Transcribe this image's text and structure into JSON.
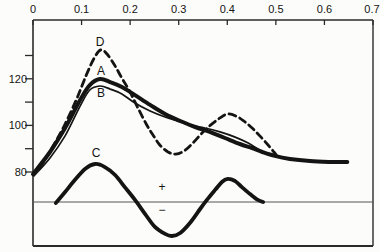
{
  "figure": {
    "background": "#fcfcfa",
    "ink_color": "#141414",
    "frame_color": "#2a2a2a",
    "baseline_color": "#555555"
  },
  "chart_data": {
    "type": "line",
    "title": "",
    "xlabel": "",
    "ylabel": "",
    "grid": false,
    "legend": "none (curves labeled inline: D, A, B, C)",
    "x_axis": {
      "position": "top",
      "range": [
        0,
        0.7
      ],
      "tick_values": [
        0,
        0.1,
        0.2,
        0.3,
        0.4,
        0.5,
        0.6,
        0.7
      ],
      "tick_labels": [
        "0",
        "0.1",
        "0.2",
        "0.3",
        "0.4",
        "0.5",
        "0.6",
        "0.7"
      ]
    },
    "y_axis": {
      "position": "left",
      "tick_values": [
        130,
        120,
        110,
        100,
        90,
        80
      ],
      "tick_labels": [
        "",
        "120",
        "",
        "100",
        "",
        "80"
      ]
    },
    "baseline": {
      "note": "zero line for difference curve C",
      "y_value": 0
    },
    "series": [
      {
        "name": "A",
        "style": "solid-thick",
        "width": 4.0,
        "dashed": false,
        "scale": "y",
        "points": [
          [
            0.0,
            79.1
          ],
          [
            0.035,
            88.6
          ],
          [
            0.066,
            98.9
          ],
          [
            0.097,
            110.9
          ],
          [
            0.117,
            117.3
          ],
          [
            0.138,
            119.9
          ],
          [
            0.159,
            118.6
          ],
          [
            0.183,
            116.5
          ],
          [
            0.21,
            113.0
          ],
          [
            0.241,
            108.8
          ],
          [
            0.272,
            104.9
          ],
          [
            0.303,
            101.9
          ],
          [
            0.334,
            99.3
          ],
          [
            0.364,
            97.2
          ],
          [
            0.395,
            94.6
          ],
          [
            0.426,
            92.0
          ],
          [
            0.451,
            90.3
          ],
          [
            0.472,
            88.6
          ],
          [
            0.498,
            86.9
          ],
          [
            0.529,
            85.6
          ],
          [
            0.57,
            84.7
          ],
          [
            0.612,
            84.3
          ],
          [
            0.647,
            84.3
          ]
        ]
      },
      {
        "name": "B",
        "style": "solid-thin",
        "width": 1.7,
        "dashed": false,
        "scale": "y",
        "points": [
          [
            0.002,
            78.3
          ],
          [
            0.035,
            86.0
          ],
          [
            0.066,
            95.5
          ],
          [
            0.097,
            108.3
          ],
          [
            0.117,
            115.2
          ],
          [
            0.138,
            116.9
          ],
          [
            0.159,
            115.6
          ],
          [
            0.183,
            113.5
          ],
          [
            0.21,
            109.6
          ],
          [
            0.241,
            106.2
          ],
          [
            0.272,
            103.6
          ],
          [
            0.299,
            101.9
          ],
          [
            0.323,
            100.2
          ],
          [
            0.354,
            98.9
          ],
          [
            0.385,
            97.2
          ],
          [
            0.416,
            95.0
          ],
          [
            0.443,
            92.4
          ],
          [
            0.463,
            89.9
          ],
          [
            0.472,
            88.6
          ]
        ]
      },
      {
        "name": "D",
        "style": "dashed-thick",
        "width": 2.8,
        "dashed": true,
        "scale": "y",
        "points": [
          [
            0.014,
            81.7
          ],
          [
            0.039,
            90.3
          ],
          [
            0.064,
            99.7
          ],
          [
            0.089,
            110.9
          ],
          [
            0.109,
            121.2
          ],
          [
            0.126,
            128.9
          ],
          [
            0.14,
            132.4
          ],
          [
            0.154,
            130.2
          ],
          [
            0.169,
            125.5
          ],
          [
            0.183,
            120.3
          ],
          [
            0.2,
            114.3
          ],
          [
            0.216,
            107.5
          ],
          [
            0.233,
            100.6
          ],
          [
            0.247,
            95.9
          ],
          [
            0.261,
            91.6
          ],
          [
            0.278,
            88.6
          ],
          [
            0.294,
            87.7
          ],
          [
            0.311,
            89.0
          ],
          [
            0.329,
            92.4
          ],
          [
            0.348,
            96.7
          ],
          [
            0.366,
            100.2
          ],
          [
            0.385,
            103.2
          ],
          [
            0.401,
            104.9
          ],
          [
            0.418,
            104.0
          ],
          [
            0.434,
            101.9
          ],
          [
            0.451,
            98.9
          ],
          [
            0.467,
            95.5
          ],
          [
            0.484,
            91.6
          ],
          [
            0.496,
            88.6
          ],
          [
            0.502,
            86.9
          ]
        ]
      },
      {
        "name": "C",
        "style": "solid-thick",
        "width": 3.8,
        "dashed": false,
        "scale": "baseline",
        "points": [
          [
            0.047,
            -0.4
          ],
          [
            0.066,
            4.3
          ],
          [
            0.086,
            9.4
          ],
          [
            0.107,
            14.2
          ],
          [
            0.128,
            16.3
          ],
          [
            0.148,
            15.0
          ],
          [
            0.169,
            11.6
          ],
          [
            0.189,
            6.4
          ],
          [
            0.21,
            0.9
          ],
          [
            0.231,
            -5.2
          ],
          [
            0.251,
            -10.7
          ],
          [
            0.272,
            -13.7
          ],
          [
            0.286,
            -14.6
          ],
          [
            0.303,
            -13.3
          ],
          [
            0.323,
            -9.0
          ],
          [
            0.344,
            -3.0
          ],
          [
            0.358,
            0.9
          ],
          [
            0.375,
            5.2
          ],
          [
            0.389,
            8.6
          ],
          [
            0.401,
            9.9
          ],
          [
            0.416,
            9.0
          ],
          [
            0.43,
            6.4
          ],
          [
            0.447,
            3.4
          ],
          [
            0.463,
            0.9
          ],
          [
            0.474,
            0.0
          ]
        ]
      }
    ],
    "curve_labels": [
      {
        "text": "D",
        "x_px": 100,
        "y_px": 46
      },
      {
        "text": "A",
        "x_px": 101,
        "y_px": 75
      },
      {
        "text": "B",
        "x_px": 101,
        "y_px": 97
      },
      {
        "text": "C",
        "x_px": 96,
        "y_px": 157
      }
    ],
    "annotations": [
      {
        "text": "+",
        "x_px": 162,
        "y_px": 191
      },
      {
        "text": "−",
        "x_px": 162,
        "y_px": 214
      }
    ],
    "layout_hints": {
      "plot_left_px": 33,
      "plot_right_px": 373,
      "plot_top_px": 20,
      "plot_bottom_px": 246,
      "y80_px": 172,
      "px_per_unit": 2.33,
      "baseline_y_px": 202,
      "x_tick_len_px": 5,
      "y_tick_len_px": 8,
      "x_label_y_px": 13,
      "y_label_right_px": 27
    }
  }
}
